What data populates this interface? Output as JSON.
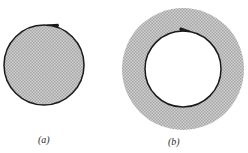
{
  "figure": {
    "background_color": "#ffffff",
    "stroke_color": "#1a1a1a",
    "shade_color": "#b9b9b9",
    "shade_dot_color": "#8f8f8f",
    "panels": [
      {
        "id": "panel-a",
        "caption": "(a)",
        "shape": "filled-disk",
        "description": "shaded disk with oriented boundary circle",
        "center_x": 44,
        "center_y": 65,
        "radius": 40,
        "orientation": "counterclockwise",
        "arrow_angle_deg": 282,
        "arrow_direction": "left"
      },
      {
        "id": "panel-b",
        "caption": "(b)",
        "shape": "annulus",
        "description": "shaded annulus with oriented inner boundary circle",
        "center_x": 183,
        "center_y": 69,
        "outer_radius": 61,
        "inner_radius": 38,
        "orientation": "clockwise",
        "arrow_angle_deg": 274,
        "arrow_direction": "right"
      }
    ]
  },
  "captions": {
    "a": "(a)",
    "b": "(b)"
  }
}
